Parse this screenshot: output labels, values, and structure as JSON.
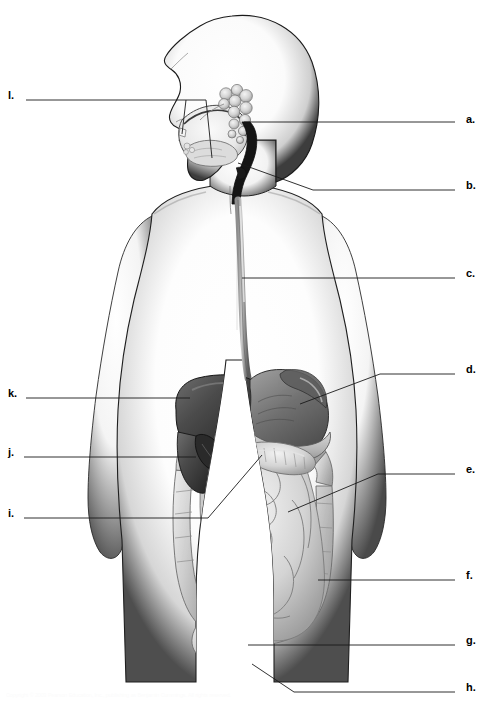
{
  "figure": {
    "view": "lateral-anterior composite of head and torso with digestive organs",
    "background_color": "#ffffff",
    "line_color": "#1a1a1a",
    "label_color": "#000000",
    "width": 480,
    "height": 708
  },
  "labels": [
    {
      "id": "a",
      "text": "a.",
      "side": "right",
      "x": 466,
      "y": 120
    },
    {
      "id": "b",
      "text": "b.",
      "side": "right",
      "x": 466,
      "y": 186
    },
    {
      "id": "c",
      "text": "c.",
      "side": "right",
      "x": 466,
      "y": 274
    },
    {
      "id": "d",
      "text": "d.",
      "side": "right",
      "x": 466,
      "y": 370
    },
    {
      "id": "e",
      "text": "e.",
      "side": "right",
      "x": 466,
      "y": 470
    },
    {
      "id": "f",
      "text": "f.",
      "side": "right",
      "x": 466,
      "y": 572
    },
    {
      "id": "g",
      "text": "g.",
      "side": "right",
      "x": 466,
      "y": 641
    },
    {
      "id": "h",
      "text": "h.",
      "side": "right",
      "x": 466,
      "y": 688
    },
    {
      "id": "i",
      "text": "i.",
      "side": "left",
      "x": 8,
      "y": 512
    },
    {
      "id": "j",
      "text": "j.",
      "side": "left",
      "x": 8,
      "y": 451
    },
    {
      "id": "k",
      "text": "k.",
      "side": "left",
      "x": 8,
      "y": 392
    },
    {
      "id": "l",
      "text": "l.",
      "side": "left",
      "x": 8,
      "y": 94
    }
  ],
  "caption": {
    "text": "Copyright © 2003 Pearson Education, Inc., publishing as Benjamin Cummings. All rights reserved."
  },
  "colors": {
    "body_outline": "#111111",
    "body_fill": "#ffffff",
    "body_shadow": "#5a5a5a",
    "liver": "#4a4a4a",
    "liver_dark": "#2e2e2e",
    "stomach": "#7b7b7b",
    "stomach_light": "#bdbdbd",
    "intestine": "#c9c9c9",
    "intestine_light": "#e2e2e2",
    "gallbladder": "#3a3a3a",
    "pancreas": "#b5b5b5",
    "salivary": "#d8d8d8",
    "pharynx": "#1c1c1c",
    "oral_cavity": "#ececec"
  }
}
